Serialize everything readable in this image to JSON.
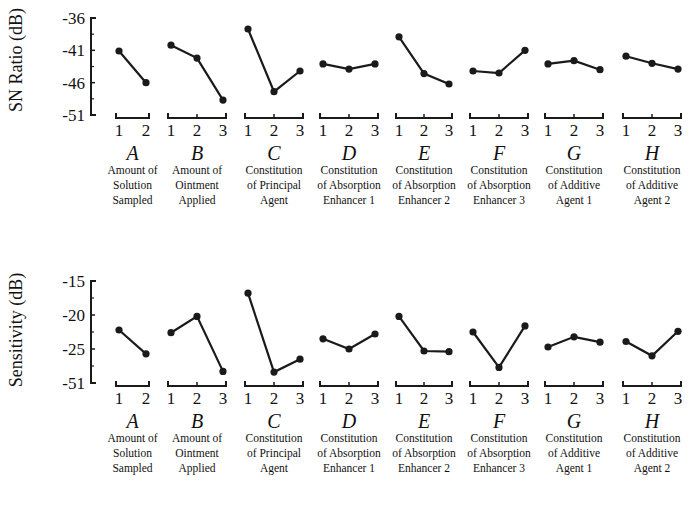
{
  "chart_data": [
    {
      "type": "line",
      "title": "",
      "ylabel": "SN Ratio (dB)",
      "yticks": [
        "-36",
        "-41",
        "-46",
        "-51"
      ],
      "ylim": [
        -51,
        -36
      ],
      "factors": [
        {
          "letter": "A",
          "desc": [
            "Amount of",
            "Solution",
            "Sampled"
          ],
          "levels": [
            "1",
            "2"
          ],
          "values": [
            -41.1,
            -46.0
          ]
        },
        {
          "letter": "B",
          "desc": [
            "Amount of",
            "Ointment",
            "Applied"
          ],
          "levels": [
            "1",
            "2",
            "3"
          ],
          "values": [
            -40.2,
            -42.2,
            -48.7
          ]
        },
        {
          "letter": "C",
          "desc": [
            "Constitution",
            "of Principal",
            "Agent"
          ],
          "levels": [
            "1",
            "2",
            "3"
          ],
          "values": [
            -37.7,
            -47.4,
            -44.2
          ]
        },
        {
          "letter": "D",
          "desc": [
            "Constitution",
            "of Absorption",
            "Enhancer 1"
          ],
          "levels": [
            "1",
            "2",
            "3"
          ],
          "values": [
            -43.1,
            -43.9,
            -43.1
          ]
        },
        {
          "letter": "E",
          "desc": [
            "Constitution",
            "of Absorption",
            "Enhancer 2"
          ],
          "levels": [
            "1",
            "2",
            "3"
          ],
          "values": [
            -38.9,
            -44.6,
            -46.2
          ]
        },
        {
          "letter": "F",
          "desc": [
            "Constitution",
            "of Absorption",
            "Enhancer 3"
          ],
          "levels": [
            "1",
            "2",
            "3"
          ],
          "values": [
            -44.2,
            -44.5,
            -41.0
          ]
        },
        {
          "letter": "G",
          "desc": [
            "Constitution",
            "of Additive",
            "Agent 1"
          ],
          "levels": [
            "1",
            "2",
            "3"
          ],
          "values": [
            -43.1,
            -42.6,
            -44.0
          ]
        },
        {
          "letter": "H",
          "desc": [
            "Constitution",
            "of Additive",
            "Agent 2"
          ],
          "levels": [
            "1",
            "2",
            "3"
          ],
          "values": [
            -41.9,
            -43.0,
            -43.9
          ]
        }
      ]
    },
    {
      "type": "line",
      "title": "",
      "ylabel": "Sensitivity (dB)",
      "yticks": [
        "-15",
        "-20",
        "-25",
        "-51"
      ],
      "ylim": [
        -30,
        -15
      ],
      "factors": [
        {
          "letter": "A",
          "desc": [
            "Amount of",
            "Solution",
            "Sampled"
          ],
          "levels": [
            "1",
            "2"
          ],
          "values": [
            -22.2,
            -25.7
          ]
        },
        {
          "letter": "B",
          "desc": [
            "Amount of",
            "Ointment",
            "Applied"
          ],
          "levels": [
            "1",
            "2",
            "3"
          ],
          "values": [
            -22.6,
            -20.2,
            -28.3
          ]
        },
        {
          "letter": "C",
          "desc": [
            "Constitution",
            "of Principal",
            "Agent"
          ],
          "levels": [
            "1",
            "2",
            "3"
          ],
          "values": [
            -16.8,
            -28.4,
            -26.5
          ]
        },
        {
          "letter": "D",
          "desc": [
            "Constitution",
            "of Absorption",
            "Enhancer 1"
          ],
          "levels": [
            "1",
            "2",
            "3"
          ],
          "values": [
            -23.5,
            -25.0,
            -22.8
          ]
        },
        {
          "letter": "E",
          "desc": [
            "Constitution",
            "of Absorption",
            "Enhancer 2"
          ],
          "levels": [
            "1",
            "2",
            "3"
          ],
          "values": [
            -20.2,
            -25.3,
            -25.4
          ]
        },
        {
          "letter": "F",
          "desc": [
            "Constitution",
            "of Absorption",
            "Enhancer 3"
          ],
          "levels": [
            "1",
            "2",
            "3"
          ],
          "values": [
            -22.5,
            -27.7,
            -21.6
          ]
        },
        {
          "letter": "G",
          "desc": [
            "Constitution",
            "of Additive",
            "Agent 1"
          ],
          "levels": [
            "1",
            "2",
            "3"
          ],
          "values": [
            -24.7,
            -23.2,
            -24.0
          ]
        },
        {
          "letter": "H",
          "desc": [
            "Constitution",
            "of Additive",
            "Agent 2"
          ],
          "levels": [
            "1",
            "2",
            "3"
          ],
          "values": [
            -23.9,
            -26.0,
            -22.4
          ]
        }
      ]
    }
  ],
  "colors": {
    "line": "#1a1a1a",
    "background": "#ffffff"
  }
}
